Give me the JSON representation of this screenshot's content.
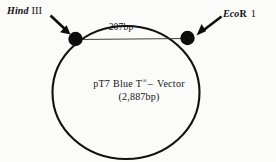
{
  "figure": {
    "type": "plasmid-map",
    "background_color": "#fbfbfa",
    "line_color": "#111111"
  },
  "plasmid": {
    "name_prefix": "pT7",
    "name_middle": "Blue",
    "name_tmark": "T",
    "name_superscript": "®",
    "name_dash": "–",
    "name_suffix": "Vector",
    "size_label": "(2,887bp)",
    "full_name": "pT7 Blue T® – Vector"
  },
  "fragment": {
    "size_label": "207bp"
  },
  "sites": [
    {
      "id": "hind3",
      "enzyme_italic": "Hind",
      "enzyme_roman": "III",
      "full_label": "Hind III",
      "marker": "filled-dot",
      "position": "top-left"
    },
    {
      "id": "ecor1",
      "enzyme_italic": "Eco",
      "enzyme_bold": "R",
      "enzyme_roman": "1",
      "full_label": "EcoR 1",
      "marker": "filled-dot",
      "position": "top-right"
    }
  ],
  "annotations": {
    "arrow_left_name": "arrow-to-hind3-site",
    "arrow_right_name": "arrow-to-ecor1-site",
    "chord_name": "fragment-chord-line"
  }
}
